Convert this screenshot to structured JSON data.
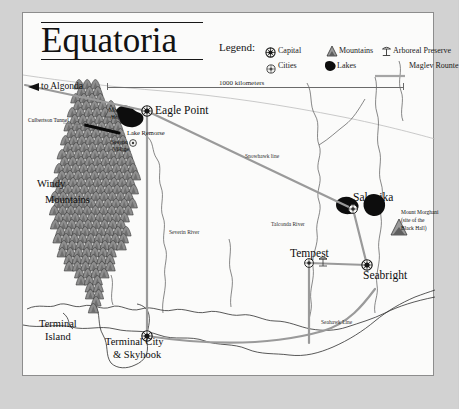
{
  "map": {
    "title": "Equatoria",
    "edge_note": "to Algonda",
    "scale": {
      "label": "1000 kilometers",
      "length_px": 296
    }
  },
  "legend": {
    "label": "Legend:",
    "items": [
      {
        "key": "capital",
        "label": "Capital",
        "icon": "capital-marker-icon"
      },
      {
        "key": "mountains",
        "label": "Mountains",
        "icon": "mountain-icon"
      },
      {
        "key": "preserve",
        "label": "Arboreal Preserve",
        "icon": "arboreal-preserve-icon"
      },
      {
        "key": "cities",
        "label": "Cities",
        "icon": "city-marker-icon"
      },
      {
        "key": "lakes",
        "label": "Lakes",
        "icon": "lake-icon"
      },
      {
        "key": "maglev",
        "label": "Maglev Rounte",
        "icon": "maglev-line-icon"
      }
    ]
  },
  "settlements": [
    {
      "name": "Eagle Point",
      "type": "capital"
    },
    {
      "name": "Salonika",
      "type": "cities"
    },
    {
      "name": "Tempest",
      "type": "cities"
    },
    {
      "name": "Seabright",
      "type": "capital"
    },
    {
      "name": "Terminal City\n& Skyhook",
      "type": "capital"
    },
    {
      "name": "Severin\nVillage",
      "type": "cities"
    }
  ],
  "labels": {
    "eagle_point": "Eagle Point",
    "salonika": "Salonika",
    "tempest": "Tempest",
    "seabright": "Seabright",
    "terminal_city_1": "Terminal City",
    "terminal_city_2": "& Skyhook",
    "terminal_island_1": "Terminal",
    "terminal_island_2": "Island",
    "windy_mountains_1": "Windy",
    "windy_mountains_2": "Mountains",
    "mount_hope_1": "Mount",
    "mount_hope_2": "Hope",
    "lake_remorse": "Lake Remorse",
    "severin_village_1": "Severin",
    "severin_village_2": "Village",
    "culbertson_tunnel": "Culbertson Tunnel",
    "mount_morghani_1": "Mount Morghani",
    "mount_morghani_2": "(site of the",
    "mount_morghani_3": "Black Hall)",
    "severin_river": "Severin River",
    "talconda_river": "Talconda River",
    "snowhawk_line": "Snowhawk line",
    "seahawk_line": "Seahawk Line"
  },
  "colors": {
    "paper": "#fbfbfa",
    "margin": "#d2d2d2",
    "ink": "#111111",
    "frame": "#8d8d8d",
    "maglev": "#9a9a9a",
    "mountain_fill": "#8e8e8e",
    "mountain_line": "#3a3a3a",
    "lake_fill": "#0d0d0d",
    "river": "#555555",
    "coast": "#2f2f2f"
  }
}
